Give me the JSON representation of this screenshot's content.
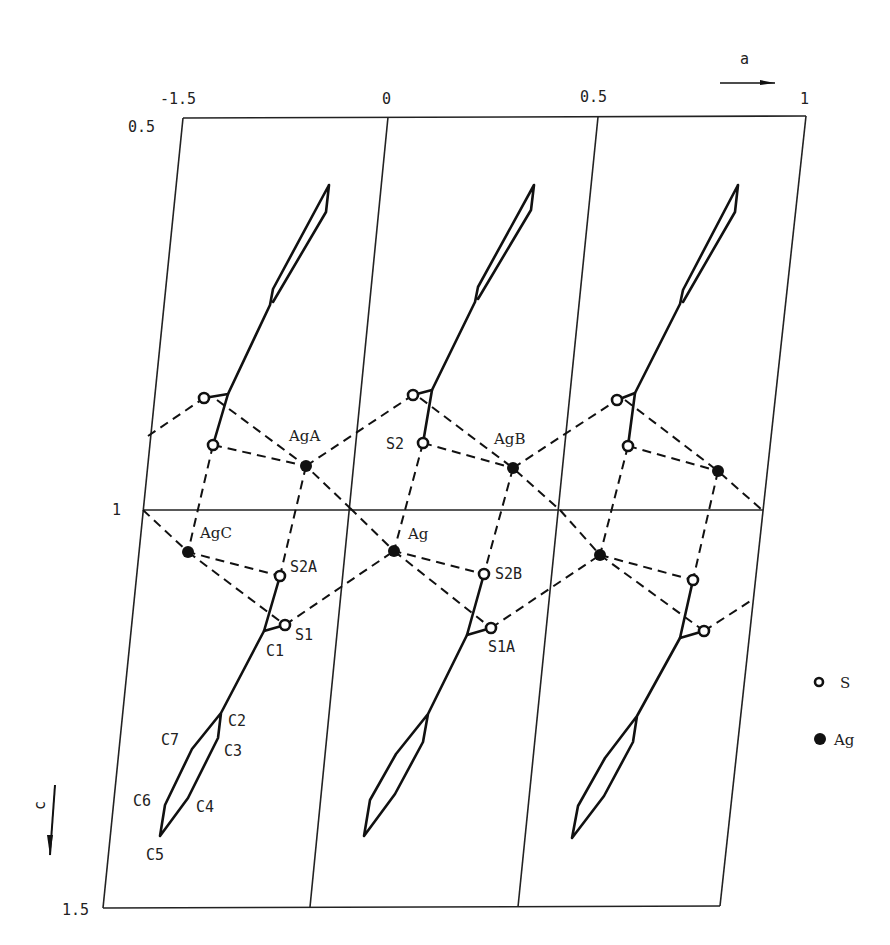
{
  "figure": {
    "type": "crystal structure projection",
    "axis_a_label": "a",
    "axis_c_label": "c",
    "top_ticks": [
      {
        "label": "-1.5",
        "x": 183
      },
      {
        "label": "0",
        "x": 388
      },
      {
        "label": "0.5",
        "x": 598
      },
      {
        "label": "1",
        "x": 806
      }
    ],
    "left_ticks": [
      {
        "label": "0.5",
        "y": 125
      },
      {
        "label": "1",
        "y": 512
      },
      {
        "label": "1.5",
        "y": 910
      }
    ],
    "atom_labels": {
      "AgA": "AgA",
      "AgB": "AgB",
      "AgC": "AgC",
      "Ag": "Ag",
      "S2": "S2",
      "S2A": "S2A",
      "S2B": "S2B",
      "S1": "S1",
      "S1A": "S1A",
      "C1": "C1",
      "C2": "C2",
      "C3": "C3",
      "C4": "C4",
      "C5": "C5",
      "C6": "C6",
      "C7": "C7"
    },
    "legend": [
      {
        "symbol": "open-circle",
        "label": "S"
      },
      {
        "symbol": "filled-circle",
        "label": "Ag"
      }
    ]
  }
}
